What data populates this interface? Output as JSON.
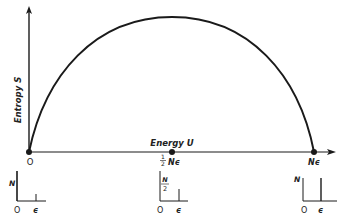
{
  "diagram": {
    "type": "entropy-vs-energy curve for two-level system",
    "y_axis_label": "Entropy S",
    "x_axis_label": "Energy U",
    "x_marks": [
      {
        "label": "O",
        "position": 0
      },
      {
        "label_frac_num": "1",
        "label_frac_den": "2",
        "label_rest": "Nϵ",
        "position": 0.5
      },
      {
        "label": "Nϵ",
        "position": 1
      }
    ],
    "curve": "semi-elliptic arch from (0,0) to (Nϵ,0), maximum at U = ½Nϵ",
    "insets": [
      {
        "name": "inset-zero-energy",
        "y_label": "N",
        "origin_label": "O",
        "x_tick_label": "ϵ",
        "bar_at_zero": "N",
        "bar_at_epsilon": "0"
      },
      {
        "name": "inset-half-energy",
        "y_label_num": "N",
        "y_label_den": "2",
        "origin_label": "O",
        "x_tick_label": "ϵ",
        "bar_at_zero": "N/2",
        "bar_at_epsilon": "N/2"
      },
      {
        "name": "inset-full-energy",
        "y_label": "N",
        "origin_label": "O",
        "x_tick_label": "ϵ",
        "bar_at_zero": "0",
        "bar_at_epsilon": "N"
      }
    ]
  },
  "colors": {
    "ink": "#1a1a1a",
    "background": "#ffffff"
  }
}
